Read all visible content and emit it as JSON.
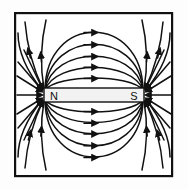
{
  "figure": {
    "name": "bar-magnet-field-lines-diagram",
    "background_color": "#fdfdfd",
    "line_color": "#111111",
    "border": {
      "name": "outer-frame",
      "x": 14,
      "y": 12,
      "width": 159,
      "height": 165,
      "stroke_color": "#111111",
      "stroke_width": 2.2,
      "fill": "#ffffff"
    },
    "magnet": {
      "name": "bar-magnet",
      "x": 44,
      "y": 88,
      "width": 100,
      "height": 14,
      "fill": "#f2f2f2",
      "stroke_color": "#111111",
      "stroke_width": 1.4,
      "north_label": "N",
      "south_label": "S",
      "north_label_x": 54,
      "south_label_x": 134,
      "label_y": 99,
      "label_font_size": 11
    },
    "poles": {
      "north_x": 44,
      "south_x": 144,
      "center_y": 95
    },
    "field_lines": {
      "arrow_color": "#111111",
      "stroke_width": 1.5,
      "inner_loops_above": [
        {
          "name": "loop-above-1",
          "apex_y": 80,
          "spread": 10
        },
        {
          "name": "loop-above-2",
          "apex_y": 69,
          "spread": 16
        },
        {
          "name": "loop-above-3",
          "apex_y": 58,
          "spread": 22
        },
        {
          "name": "loop-above-4",
          "apex_y": 46,
          "spread": 28
        },
        {
          "name": "loop-above-5",
          "apex_y": 34,
          "spread": 34
        }
      ],
      "inner_loops_below": [
        {
          "name": "loop-below-1",
          "apex_y": 110,
          "spread": 10
        },
        {
          "name": "loop-below-2",
          "apex_y": 121,
          "spread": 16
        },
        {
          "name": "loop-below-3",
          "apex_y": 132,
          "spread": 22
        },
        {
          "name": "loop-below-4",
          "apex_y": 144,
          "spread": 28
        },
        {
          "name": "loop-below-5",
          "apex_y": 156,
          "spread": 34
        }
      ],
      "outer_lines_count": 4,
      "pole_fan_count_each": 7,
      "axis_arrow_left": {
        "name": "axis-arrow-left",
        "direction": "right"
      },
      "axis_arrow_right": {
        "name": "axis-arrow-right",
        "direction": "left"
      }
    }
  }
}
